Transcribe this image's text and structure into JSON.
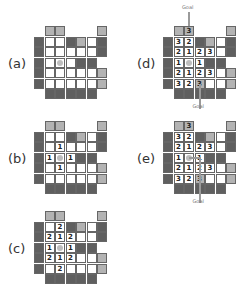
{
  "layout": {
    "rows": [
      "_LL___L_",
      "DWWDLWD",
      "DWWWWWD",
      "DWWWDD_",
      "DWWWWWL",
      "DWWWWWL",
      "_DDDDD_"
    ],
    "agent": {
      "row": 3,
      "col": 2
    }
  },
  "panels": [
    {
      "id": "a",
      "label": "(a)",
      "x": 34,
      "y": 26,
      "numbers": []
    },
    {
      "id": "b",
      "label": "(b)",
      "x": 34,
      "y": 121,
      "numbers": [
        {
          "r": 2,
          "c": 2,
          "v": "1"
        },
        {
          "r": 3,
          "c": 1,
          "v": "1"
        },
        {
          "r": 3,
          "c": 3,
          "v": "1"
        },
        {
          "r": 4,
          "c": 2,
          "v": "1"
        }
      ]
    },
    {
      "id": "c",
      "label": "(c)",
      "x": 34,
      "y": 211,
      "numbers": [
        {
          "r": 1,
          "c": 2,
          "v": "2"
        },
        {
          "r": 2,
          "c": 1,
          "v": "2"
        },
        {
          "r": 2,
          "c": 2,
          "v": "1"
        },
        {
          "r": 2,
          "c": 3,
          "v": "2"
        },
        {
          "r": 3,
          "c": 1,
          "v": "1"
        },
        {
          "r": 3,
          "c": 3,
          "v": "1"
        },
        {
          "r": 4,
          "c": 1,
          "v": "2"
        },
        {
          "r": 4,
          "c": 2,
          "v": "1"
        },
        {
          "r": 4,
          "c": 3,
          "v": "2"
        },
        {
          "r": 5,
          "c": 2,
          "v": "2"
        }
      ]
    },
    {
      "id": "d",
      "label": "(d)",
      "x": 163,
      "y": 26,
      "goal_top": "Goal",
      "goal_bottom": "Goal",
      "path": false,
      "numbers": [
        {
          "r": 0,
          "c": 2,
          "v": "3"
        },
        {
          "r": 1,
          "c": 1,
          "v": "3"
        },
        {
          "r": 1,
          "c": 2,
          "v": "2"
        },
        {
          "r": 2,
          "c": 1,
          "v": "2"
        },
        {
          "r": 2,
          "c": 2,
          "v": "1"
        },
        {
          "r": 2,
          "c": 3,
          "v": "2"
        },
        {
          "r": 2,
          "c": 4,
          "v": "3"
        },
        {
          "r": 3,
          "c": 1,
          "v": "1"
        },
        {
          "r": 3,
          "c": 3,
          "v": "1"
        },
        {
          "r": 4,
          "c": 1,
          "v": "2"
        },
        {
          "r": 4,
          "c": 2,
          "v": "1"
        },
        {
          "r": 4,
          "c": 3,
          "v": "2"
        },
        {
          "r": 4,
          "c": 4,
          "v": "3"
        },
        {
          "r": 5,
          "c": 1,
          "v": "3"
        },
        {
          "r": 5,
          "c": 2,
          "v": "2"
        },
        {
          "r": 5,
          "c": 3,
          "v": "3"
        }
      ]
    },
    {
      "id": "e",
      "label": "(e)",
      "x": 163,
      "y": 121,
      "goal_bottom": "Goal",
      "path": true,
      "numbers": [
        {
          "r": 0,
          "c": 2,
          "v": "3"
        },
        {
          "r": 1,
          "c": 1,
          "v": "3"
        },
        {
          "r": 1,
          "c": 2,
          "v": "2"
        },
        {
          "r": 2,
          "c": 1,
          "v": "2"
        },
        {
          "r": 2,
          "c": 2,
          "v": "1"
        },
        {
          "r": 2,
          "c": 3,
          "v": "2"
        },
        {
          "r": 2,
          "c": 4,
          "v": "3"
        },
        {
          "r": 3,
          "c": 1,
          "v": "1"
        },
        {
          "r": 3,
          "c": 3,
          "v": "1"
        },
        {
          "r": 4,
          "c": 1,
          "v": "2"
        },
        {
          "r": 4,
          "c": 2,
          "v": "1"
        },
        {
          "r": 4,
          "c": 3,
          "v": "2"
        },
        {
          "r": 4,
          "c": 4,
          "v": "3"
        },
        {
          "r": 5,
          "c": 1,
          "v": "3"
        },
        {
          "r": 5,
          "c": 2,
          "v": "2"
        },
        {
          "r": 5,
          "c": 3,
          "v": "3"
        }
      ]
    }
  ],
  "colors": {
    "wall_dark": "#5f5f5f",
    "wall_light": "#b3b3b3",
    "floor": "#ffffff",
    "agent": "#bdbdbd"
  }
}
